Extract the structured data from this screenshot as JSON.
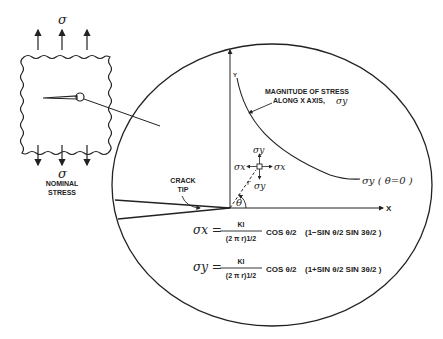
{
  "figure": {
    "specimen": {
      "top_stress_label": "σ",
      "bottom_stress_label": "σ",
      "nominal_label_line1": "NOMINAL",
      "nominal_label_line2": "STRESS"
    },
    "magnified_view": {
      "y_axis_label": "Y",
      "x_axis_label": "X",
      "curve_annotation_line1": "MAGNITUDE OF STRESS",
      "curve_annotation_line2": "ALONG X AXIS,",
      "curve_annotation_symbol": "σy",
      "curve_label": "σy ( θ=0 )",
      "crack_tip_line1": "CRACK",
      "crack_tip_line2": "TIP",
      "element_sigma_y_top": "σy",
      "element_sigma_y_bottom": "σy",
      "element_sigma_x_left": "σx",
      "element_sigma_x_right": "σx",
      "r_label": "r",
      "theta_label": "θ"
    },
    "equations": [
      {
        "lhs": "σx =",
        "numerator": "KI",
        "denominator": "(2 π r)1/2",
        "cos_term": "COS θ/2",
        "bracket": "(1−SIN θ/2 SIN 3θ/2 )"
      },
      {
        "lhs": "σy =",
        "numerator": "KI",
        "denominator": "(2 π r)1/2",
        "cos_term": "COS θ/2",
        "bracket": "(1+SIN θ/2 SIN 3θ/2 )"
      }
    ]
  }
}
